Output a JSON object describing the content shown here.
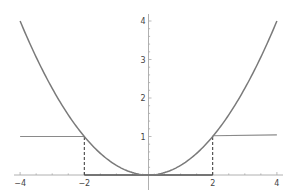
{
  "chart_data": {
    "type": "line",
    "title": "",
    "xlabel": "",
    "ylabel": "",
    "xlim": [
      -4,
      4
    ],
    "ylim": [
      0,
      4
    ],
    "grid": false,
    "x_ticks": [
      "-4",
      "-2",
      "2",
      "4"
    ],
    "y_ticks": [
      "1",
      "2",
      "3",
      "4"
    ],
    "series": [
      {
        "name": "parabola",
        "formula": "y = x^2/4",
        "x": [
          -4,
          -3,
          -2,
          -1,
          0,
          1,
          2,
          3,
          4
        ],
        "values": [
          4,
          2.25,
          1,
          0.25,
          0,
          0.25,
          1,
          2.25,
          4
        ],
        "color": "#7a7a7a"
      },
      {
        "name": "step",
        "description": "1 for |x|>2, 0 for |x|<2",
        "x": [
          -4,
          -2,
          -2,
          2,
          2,
          4
        ],
        "values": [
          1,
          1,
          0,
          0,
          1,
          1
        ],
        "color": "#8a8a8a"
      }
    ],
    "annotations": [
      {
        "type": "dashed-vline",
        "x": -2,
        "from": 0,
        "to": 1
      },
      {
        "type": "dashed-vline",
        "x": 2,
        "from": 0,
        "to": 1
      }
    ]
  }
}
